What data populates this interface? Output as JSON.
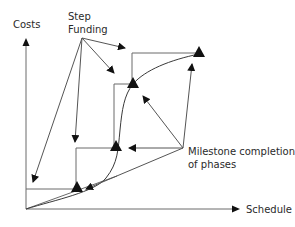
{
  "diagram": {
    "axes": {
      "y_label": "Costs",
      "x_label": "Schedule"
    },
    "annotations": {
      "step_funding_line1": "Step",
      "step_funding_line2": "Funding",
      "milestone_line1": "Milestone completion",
      "milestone_line2": "of phases"
    },
    "milestones": [
      {
        "name": "milestone-1",
        "x": 77,
        "y": 188
      },
      {
        "name": "milestone-2",
        "x": 116,
        "y": 147
      },
      {
        "name": "milestone-3",
        "x": 133,
        "y": 82
      },
      {
        "name": "milestone-4",
        "x": 199,
        "y": 52
      }
    ],
    "colors": {
      "line": "#6a6a6a",
      "marker": "#111111",
      "text": "#2a2a2a"
    }
  }
}
